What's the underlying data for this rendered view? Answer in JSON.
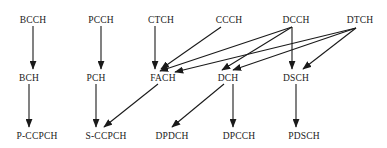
{
  "diagram": {
    "stroke_color": "#1a1a1a",
    "background_color": "#ffffff",
    "rows": [
      {
        "name": "logical-channels",
        "y": 20,
        "nodes": [
          {
            "id": "BCCH",
            "label": "BCCH",
            "x": 33
          },
          {
            "id": "PCCH",
            "label": "PCCH",
            "x": 101
          },
          {
            "id": "CTCH",
            "label": "CTCH",
            "x": 161
          },
          {
            "id": "CCCH",
            "label": "CCCH",
            "x": 229
          },
          {
            "id": "DCCH",
            "label": "DCCH",
            "x": 296
          },
          {
            "id": "DTCH",
            "label": "DTCH",
            "x": 360
          }
        ]
      },
      {
        "name": "transport-channels",
        "y": 78,
        "nodes": [
          {
            "id": "BCH",
            "label": "BCH",
            "x": 29
          },
          {
            "id": "PCH",
            "label": "PCH",
            "x": 96
          },
          {
            "id": "FACH",
            "label": "FACH",
            "x": 163
          },
          {
            "id": "DCH",
            "label": "DCH",
            "x": 228
          },
          {
            "id": "DSCH",
            "label": "DSCH",
            "x": 296
          }
        ]
      },
      {
        "name": "physical-channels",
        "y": 136,
        "nodes": [
          {
            "id": "P-CCPCH",
            "label": "P-CCPCH",
            "x": 37
          },
          {
            "id": "S-CCPCH",
            "label": "S-CCPCH",
            "x": 106
          },
          {
            "id": "DPDCH",
            "label": "DPDCH",
            "x": 172
          },
          {
            "id": "DPCCH",
            "label": "DPCCH",
            "x": 239
          },
          {
            "id": "PDSCH",
            "label": "PDSCH",
            "x": 304
          }
        ]
      }
    ],
    "edges": [
      {
        "id": "bcch-bch",
        "from": "BCCH",
        "to": "BCH",
        "x1": 33,
        "y1": 26,
        "x2": 33,
        "y2": 69
      },
      {
        "id": "pcch-pch",
        "from": "PCCH",
        "to": "PCH",
        "x1": 101,
        "y1": 26,
        "x2": 101,
        "y2": 69
      },
      {
        "id": "ctch-fach",
        "from": "CTCH",
        "to": "FACH",
        "x1": 155,
        "y1": 26,
        "x2": 155,
        "y2": 69
      },
      {
        "id": "ccch-fach",
        "from": "CCCH",
        "to": "FACH",
        "x1": 221,
        "y1": 27,
        "x2": 161,
        "y2": 69
      },
      {
        "id": "dcch-fach",
        "from": "DCCH",
        "to": "FACH",
        "x1": 292,
        "y1": 27,
        "x2": 160,
        "y2": 71
      },
      {
        "id": "dcch-dch",
        "from": "DCCH",
        "to": "DCH",
        "x1": 292,
        "y1": 27,
        "x2": 222,
        "y2": 70
      },
      {
        "id": "dcch-dsch",
        "from": "DCCH",
        "to": "DSCH",
        "x1": 292,
        "y1": 27,
        "x2": 292,
        "y2": 69
      },
      {
        "id": "dtch-fach",
        "from": "DTCH",
        "to": "FACH",
        "x1": 356,
        "y1": 28,
        "x2": 175,
        "y2": 72
      },
      {
        "id": "dtch-dch",
        "from": "DTCH",
        "to": "DCH",
        "x1": 356,
        "y1": 28,
        "x2": 233,
        "y2": 70
      },
      {
        "id": "dtch-dsch",
        "from": "DTCH",
        "to": "DSCH",
        "x1": 356,
        "y1": 28,
        "x2": 303,
        "y2": 69
      },
      {
        "id": "bch-pccpch",
        "from": "BCH",
        "to": "P-CCPCH",
        "x1": 29,
        "y1": 84,
        "x2": 29,
        "y2": 127
      },
      {
        "id": "pch-sccpch",
        "from": "PCH",
        "to": "S-CCPCH",
        "x1": 96,
        "y1": 84,
        "x2": 96,
        "y2": 127
      },
      {
        "id": "fach-sccpch",
        "from": "FACH",
        "to": "S-CCPCH",
        "x1": 158,
        "y1": 84,
        "x2": 104,
        "y2": 127
      },
      {
        "id": "dch-dpdch",
        "from": "DCH",
        "to": "DPDCH",
        "x1": 224,
        "y1": 84,
        "x2": 172,
        "y2": 127
      },
      {
        "id": "dch-dpcch",
        "from": "DCH",
        "to": "DPCCH",
        "x1": 233,
        "y1": 84,
        "x2": 233,
        "y2": 127
      },
      {
        "id": "dsch-pdsch",
        "from": "DSCH",
        "to": "PDSCH",
        "x1": 296,
        "y1": 84,
        "x2": 296,
        "y2": 127
      }
    ]
  }
}
